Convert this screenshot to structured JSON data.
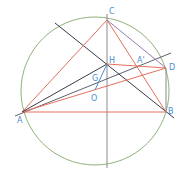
{
  "diagram": {
    "colors": {
      "circle": "#8fb27a",
      "red": "#e2715e",
      "dark": "#3a3a4a",
      "gray": "#8a8a8a",
      "purple": "#9a7aa8",
      "blue": "#4a8fd0"
    },
    "labels": {
      "C": "C",
      "H": "H",
      "A_prime": "A'",
      "D": "D",
      "G": "G",
      "O": "O",
      "A": "A",
      "B": "B"
    }
  }
}
